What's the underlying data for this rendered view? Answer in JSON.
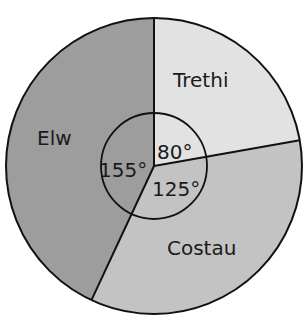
{
  "chart_data": {
    "type": "pie",
    "title": "",
    "categories": [
      "Trethi",
      "Costau",
      "Elw"
    ],
    "values": [
      80,
      125,
      155
    ],
    "unit": "degrees",
    "angle_labels": [
      "80°",
      "125°",
      "155°"
    ],
    "start_angle_deg": 0,
    "direction": "clockwise",
    "colors": [
      "#e2e2e2",
      "#c3c3c3",
      "#9d9d9d"
    ],
    "legend": "none",
    "inner_angle_circle": true
  }
}
